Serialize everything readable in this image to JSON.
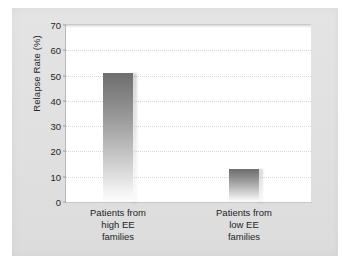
{
  "figure": {
    "panel_color": "#e0e0e0",
    "plot_background": "#ffffff"
  },
  "chart_data": {
    "type": "bar",
    "title": "",
    "xlabel": "",
    "ylabel": "Relapse Rate (%)",
    "categories": [
      "Patients from high EE families",
      "Patients from low EE families"
    ],
    "category_lines": [
      [
        "Patients from",
        "high EE",
        "families"
      ],
      [
        "Patients from",
        "low EE",
        "families"
      ]
    ],
    "values": [
      51,
      13
    ],
    "ylim": [
      0,
      70
    ],
    "yticks": [
      0,
      10,
      20,
      30,
      40,
      50,
      60,
      70
    ],
    "ytick_labels": [
      "0",
      "10",
      "20",
      "30",
      "40",
      "50",
      "60",
      "70"
    ],
    "grid": true,
    "grid_axis": "y",
    "grid_style": "dotted",
    "legend": false,
    "bar_fill": "gradient-gray-top-to-white-bottom",
    "bar_color_top": "#6e6e6e",
    "bar_color_bottom": "#fdfdfd"
  }
}
